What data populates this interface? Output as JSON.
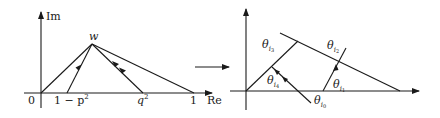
{
  "left_panel": {
    "axis_labels": {
      "im": "Im",
      "re": "Re"
    },
    "point_label": "w",
    "ticks": {
      "zero": "0",
      "one_minus_p2": "1 − p",
      "one_minus_p2_exp": "2",
      "q2": "q",
      "q2_exp": "2",
      "one": "1"
    }
  },
  "right_panel": {
    "angles": {
      "theta": "θ",
      "i0": "i",
      "i0_sub": "0",
      "i1": "i",
      "i1_sub": "1",
      "i2": "i",
      "i2_sub": "2",
      "i3": "i",
      "i3_sub": "3",
      "i4": "i",
      "i4_sub": "4"
    }
  },
  "colors": {
    "stroke": "#1a1a1a",
    "background": "#ffffff"
  }
}
